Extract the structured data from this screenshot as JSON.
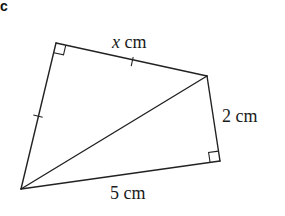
{
  "figure": {
    "part_label": "c",
    "shape": "quadrilateral split by a diagonal into two right triangles",
    "vertices": {
      "top_left": {
        "x": 56,
        "y": 43
      },
      "right": {
        "x": 207,
        "y": 76
      },
      "bottom_right": {
        "x": 220,
        "y": 161
      },
      "bottom_left": {
        "x": 21,
        "y": 189
      }
    },
    "labels": {
      "top_side_var": "x",
      "top_side_unit": " cm",
      "right_side": "2 cm",
      "bottom_side": "5 cm"
    },
    "right_angles": [
      "top_left",
      "bottom_right"
    ],
    "equal_length_ticks": [
      "top_side",
      "left_side"
    ],
    "stroke_color": "#222222"
  }
}
